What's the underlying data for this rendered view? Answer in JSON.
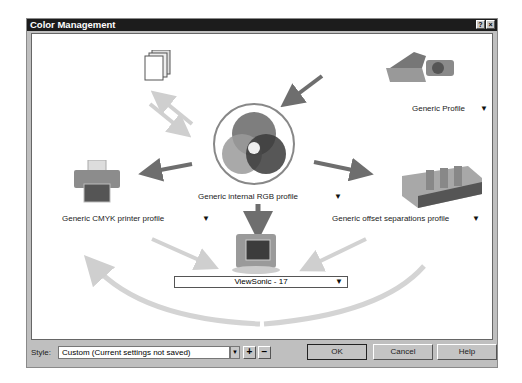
{
  "window": {
    "title": "Color Management",
    "help_glyph": "?",
    "close_glyph": "×"
  },
  "diagram": {
    "input_profile": {
      "label": "Generic Profile",
      "icon": "scanner-camera-icon"
    },
    "documents": {
      "icon": "documents-icon"
    },
    "working_profile": {
      "label": "Generic internal RGB profile",
      "icon": "rgb-circles-icon"
    },
    "printer_profile": {
      "label": "Generic CMYK printer profile",
      "icon": "printer-icon"
    },
    "separations_profile": {
      "label": "Generic offset separations profile",
      "icon": "offset-press-icon"
    },
    "monitor_profile": {
      "label": "ViewSonic - 17",
      "icon": "monitor-icon"
    },
    "dropdown_glyph": "▼"
  },
  "bottom": {
    "style_label": "Style:",
    "style_value": "Custom (Current settings not saved)",
    "add_label": "+",
    "remove_label": "−",
    "ok_label": "OK",
    "cancel_label": "Cancel",
    "help_label": "Help"
  }
}
